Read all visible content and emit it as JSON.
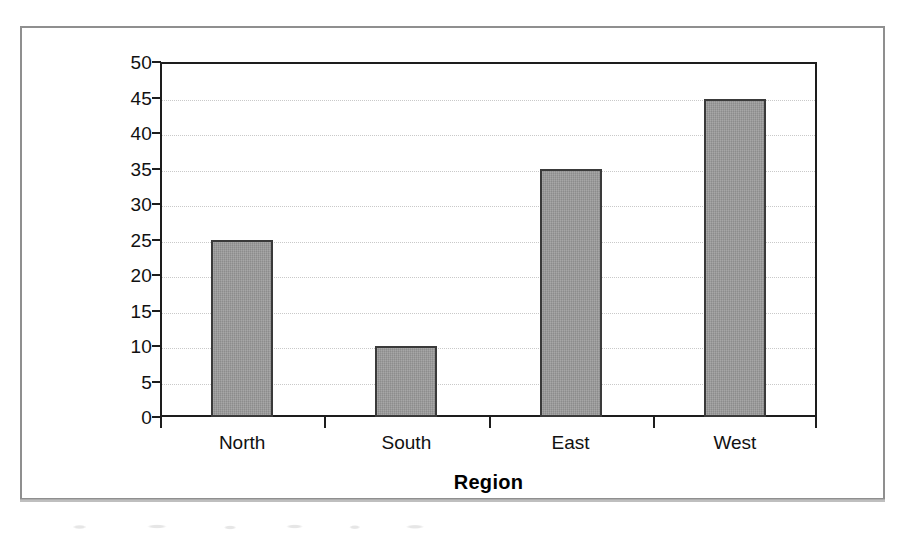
{
  "figure": {
    "frame_border_color": "#8f8f8f",
    "background_color": "#ffffff"
  },
  "chart_data": {
    "type": "bar",
    "title": "",
    "subtitle": "",
    "xlabel": "Region",
    "ylabel": "Sales",
    "categories": [
      "North",
      "South",
      "East",
      "West"
    ],
    "values": [
      25,
      10,
      35,
      44.8
    ],
    "series": [
      {
        "name": "Sales",
        "values": [
          25,
          10,
          35,
          44.8
        ]
      }
    ],
    "ylim": [
      0,
      50
    ],
    "ytick_step": 5,
    "ytick_labels": [
      "0",
      "5",
      "10",
      "15",
      "20",
      "25",
      "30",
      "35",
      "40",
      "45",
      "50"
    ],
    "ytick_values": [
      0,
      5,
      10,
      15,
      20,
      25,
      30,
      35,
      40,
      45,
      50
    ],
    "grid": true,
    "grid_axis": "y",
    "grid_style": "dotted",
    "grid_color": "#c9c9c9",
    "legend": false,
    "legend_position": "none",
    "bar_fill_color": "#9a9a9a",
    "bar_edge_color": "#3a3a3a",
    "axis_color": "#1d1d1d",
    "annotations": []
  }
}
